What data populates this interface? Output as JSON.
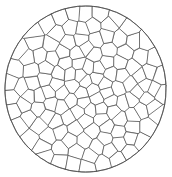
{
  "figure": {
    "description": "Polycrystalline grain structure: irregular polygonal cells tessellating a circular domain",
    "type": "voronoi-tessellation"
  },
  "canvas": {
    "width": 172,
    "height": 177,
    "background_color": "#ffffff"
  },
  "circle": {
    "center_x": 85.5,
    "center_y": 89.0,
    "radius_x": 80.5,
    "radius_y": 83.0,
    "stroke_color": "#4a4a4a",
    "stroke_width": 0.8,
    "fill_color": "#ffffff"
  },
  "cells": {
    "count": 132,
    "fill_color": "#ffffff",
    "stroke_color": "#4a4a4a",
    "stroke_width": 0.7,
    "min_diameter_px": 5,
    "max_diameter_px": 26,
    "mean_diameter_px": 13,
    "rim_density_bias": 1.55,
    "relaxation_iterations": 6,
    "random_seed": 20240917
  },
  "labels": {
    "caption": "",
    "axis_x": "",
    "axis_y": ""
  }
}
